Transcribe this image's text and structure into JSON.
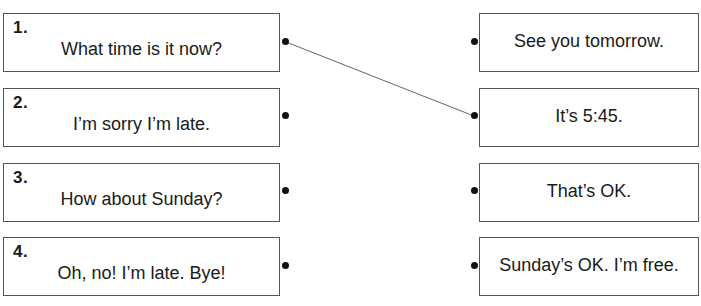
{
  "exercise": {
    "left_items": [
      {
        "number": "1.",
        "text": "What time is it now?"
      },
      {
        "number": "2.",
        "text": "I’m sorry I’m late."
      },
      {
        "number": "3.",
        "text": "How about Sunday?"
      },
      {
        "number": "4.",
        "text": "Oh, no! I’m late. Bye!"
      }
    ],
    "right_items": [
      {
        "text": "See you tomorrow."
      },
      {
        "text": "It’s 5:45."
      },
      {
        "text": "That’s OK."
      },
      {
        "text": "Sunday’s OK. I’m free."
      }
    ],
    "connections": [
      {
        "from_left": 1,
        "to_right": 2
      }
    ],
    "line_color": "#666666"
  }
}
